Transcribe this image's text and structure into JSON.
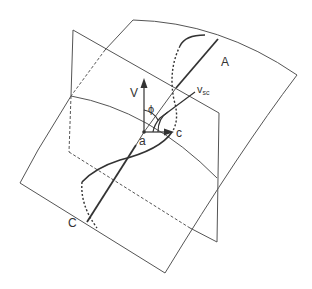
{
  "diagram": {
    "labels": {
      "A": "A",
      "C": "C",
      "V": "V",
      "phi": "ϕ",
      "a": "a",
      "c": "c",
      "vsc_main": "v",
      "vsc_sub": "sc"
    },
    "colors": {
      "line": "#555555",
      "thick": "#333333",
      "background": "#ffffff"
    }
  }
}
